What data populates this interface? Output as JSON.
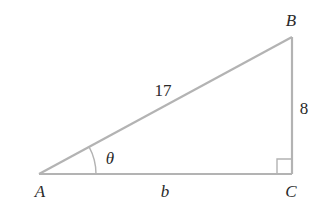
{
  "diagram": {
    "type": "right-triangle",
    "vertices": {
      "A": {
        "label": "A",
        "x": 39,
        "y": 174
      },
      "B": {
        "label": "B",
        "x": 292,
        "y": 37
      },
      "C": {
        "label": "C",
        "x": 292,
        "y": 174
      }
    },
    "sides": {
      "hypotenuse": {
        "label": "17",
        "from": "A",
        "to": "B"
      },
      "opposite": {
        "label": "8",
        "from": "C",
        "to": "B"
      },
      "adjacent": {
        "label": "b",
        "from": "A",
        "to": "C"
      }
    },
    "angle": {
      "label": "θ",
      "vertex": "A"
    },
    "right_angle_at": "C",
    "colors": {
      "line": "#b3b3b3",
      "text": "#2a2a2a",
      "background": "#ffffff"
    }
  }
}
